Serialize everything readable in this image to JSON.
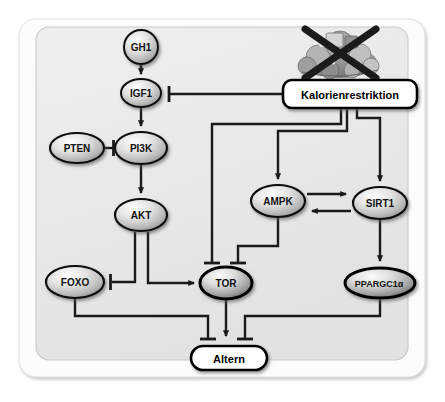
{
  "figure": {
    "language": "de",
    "background_color": "#ffffff",
    "outer_panel_color": "#fbfbfb",
    "inner_panel_color": "#ebebeb",
    "line_color": "#1a1a1a",
    "node_outline_color": "#000000"
  },
  "nodes": [
    {
      "id": "gh1",
      "label": "GH1",
      "shape": "circle",
      "style": "gradient-gray",
      "cx": 141,
      "cy": 47,
      "rx": 17,
      "ry": 17,
      "font_size": 10
    },
    {
      "id": "igf1",
      "label": "IGF1",
      "shape": "ellipse",
      "style": "gradient-gray",
      "cx": 141,
      "cy": 93,
      "rx": 20,
      "ry": 14,
      "font_size": 10
    },
    {
      "id": "pten",
      "label": "PTEN",
      "shape": "ellipse",
      "style": "gradient-gray",
      "cx": 77,
      "cy": 148,
      "rx": 27,
      "ry": 15,
      "font_size": 10
    },
    {
      "id": "pi3k",
      "label": "PI3K",
      "shape": "ellipse",
      "style": "gradient-gray",
      "cx": 141,
      "cy": 148,
      "rx": 26,
      "ry": 16,
      "font_size": 10
    },
    {
      "id": "akt",
      "label": "AKT",
      "shape": "ellipse",
      "style": "gradient-gray",
      "cx": 141,
      "cy": 215,
      "rx": 26,
      "ry": 16,
      "font_size": 10
    },
    {
      "id": "foxo",
      "label": "FOXO",
      "shape": "ellipse",
      "style": "gradient-gray",
      "cx": 75,
      "cy": 282,
      "rx": 29,
      "ry": 16,
      "font_size": 10
    },
    {
      "id": "tor",
      "label": "TOR",
      "shape": "ellipse",
      "style": "gradient-gray-dark",
      "cx": 226,
      "cy": 283,
      "rx": 26,
      "ry": 16,
      "font_size": 10
    },
    {
      "id": "ampk",
      "label": "AMPK",
      "shape": "ellipse",
      "style": "gradient-gray",
      "cx": 278,
      "cy": 201,
      "rx": 27,
      "ry": 16,
      "font_size": 10
    },
    {
      "id": "sirt1",
      "label": "SIRT1",
      "shape": "ellipse",
      "style": "gradient-gray",
      "cx": 380,
      "cy": 203,
      "rx": 27,
      "ry": 16,
      "font_size": 10
    },
    {
      "id": "ppargc1a",
      "label": "PPARGC1α",
      "shape": "ellipse",
      "style": "gradient-gray-dark",
      "cx": 380,
      "cy": 283,
      "rx": 35,
      "ry": 15,
      "font_size": 9
    }
  ],
  "boxes": [
    {
      "id": "kalorienrestriktion",
      "label": "Kalorienrestriktion",
      "shape": "rounded-rect",
      "x": 283,
      "y": 80,
      "width": 134,
      "height": 28,
      "font_size": 11,
      "fill": "#ffffff"
    },
    {
      "id": "altern",
      "label": "Altern",
      "shape": "pill",
      "x": 191,
      "y": 346,
      "width": 76,
      "height": 24,
      "font_size": 11,
      "fill": "#ffffff"
    }
  ],
  "image": {
    "id": "crossed-out-food",
    "description": "Abbildung von Nahrungsmitteln, durchgestrichen",
    "x": 300,
    "y": 20,
    "width": 80,
    "height": 62
  },
  "edges": [
    {
      "id": "gh1-igf1",
      "from": "gh1",
      "to": "igf1",
      "type": "activation-dashed"
    },
    {
      "id": "igf1-pi3k",
      "from": "igf1",
      "to": "pi3k",
      "type": "activation"
    },
    {
      "id": "pten-pi3k",
      "from": "pten",
      "to": "pi3k",
      "type": "inhibition"
    },
    {
      "id": "pi3k-akt",
      "from": "pi3k",
      "to": "akt",
      "type": "activation"
    },
    {
      "id": "akt-foxo",
      "from": "akt",
      "to": "foxo",
      "type": "inhibition"
    },
    {
      "id": "akt-tor",
      "from": "akt",
      "to": "tor",
      "type": "activation"
    },
    {
      "id": "kalorienrestriktion-igf1",
      "from": "kalorienrestriktion",
      "to": "igf1",
      "type": "inhibition"
    },
    {
      "id": "kalorienrestriktion-tor",
      "from": "kalorienrestriktion",
      "to": "tor",
      "type": "inhibition"
    },
    {
      "id": "kalorienrestriktion-ampk",
      "from": "kalorienrestriktion",
      "to": "ampk",
      "type": "activation"
    },
    {
      "id": "kalorienrestriktion-sirt1",
      "from": "kalorienrestriktion",
      "to": "sirt1",
      "type": "activation"
    },
    {
      "id": "ampk-sirt1",
      "from": "ampk",
      "to": "sirt1",
      "type": "activation"
    },
    {
      "id": "sirt1-ampk",
      "from": "sirt1",
      "to": "ampk",
      "type": "activation"
    },
    {
      "id": "ampk-tor",
      "from": "ampk",
      "to": "tor",
      "type": "inhibition"
    },
    {
      "id": "sirt1-ppargc1a",
      "from": "sirt1",
      "to": "ppargc1a",
      "type": "activation"
    },
    {
      "id": "foxo-altern",
      "from": "foxo",
      "to": "altern",
      "type": "inhibition"
    },
    {
      "id": "tor-altern",
      "from": "tor",
      "to": "altern",
      "type": "activation"
    },
    {
      "id": "ppargc1a-altern",
      "from": "ppargc1a",
      "to": "altern",
      "type": "inhibition"
    }
  ]
}
